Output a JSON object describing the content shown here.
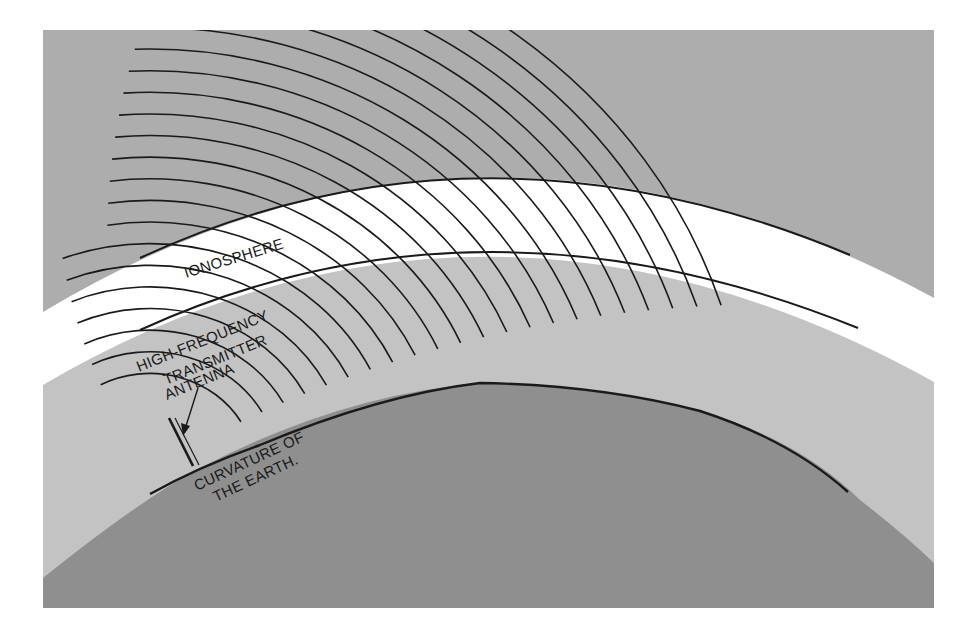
{
  "diagram": {
    "colors": {
      "background": "#ffffff",
      "sky": "#adadad",
      "ionosphere": "#ffffff",
      "lower_atmosphere": "#c3c3c3",
      "earth": "#8f8f8f",
      "lines": "#1a1a1a"
    },
    "labels": {
      "ionosphere": "IONOSPHERE",
      "antenna_line1": "HIGH-FREQUENCY",
      "antenna_line2": "TRANSMITTER",
      "antenna_line3": "ANTENNA",
      "earth_line1": "CURVATURE OF",
      "earth_line2": "THE EARTH."
    },
    "layers": [
      {
        "name": "sky",
        "description": "upper atmosphere above ionosphere"
      },
      {
        "name": "ionosphere",
        "description": "white curved band"
      },
      {
        "name": "lower-atmosphere",
        "description": "light gray band between ionosphere and earth"
      },
      {
        "name": "earth",
        "description": "dark gray curved earth surface"
      }
    ],
    "wave_front_count": 22,
    "icons": {
      "antenna": "antenna-icon",
      "arrow": "arrow-icon"
    }
  }
}
